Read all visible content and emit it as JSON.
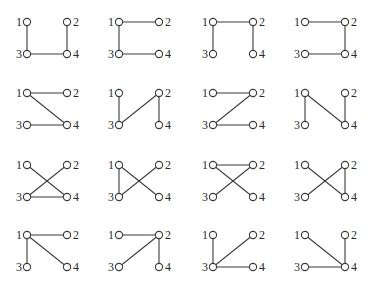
{
  "figure": {
    "colors": {
      "edge": "#3a3a3a",
      "node_stroke": "#3a3a3a",
      "node_fill": "#ffffff",
      "label": "#2a2a2a",
      "background": "#ffffff"
    },
    "node_labels": [
      "1",
      "2",
      "3",
      "4"
    ],
    "columns_x": [
      27,
      119,
      213,
      305
    ],
    "rows_y": [
      22,
      93,
      165,
      235
    ],
    "node_spacing": {
      "dx": 40,
      "dy": 32
    },
    "graphs": [
      {
        "row": 0,
        "col": 0,
        "edges": [
          [
            1,
            3
          ],
          [
            3,
            4
          ],
          [
            2,
            4
          ]
        ]
      },
      {
        "row": 0,
        "col": 1,
        "edges": [
          [
            1,
            2
          ],
          [
            1,
            3
          ],
          [
            3,
            4
          ]
        ]
      },
      {
        "row": 0,
        "col": 2,
        "edges": [
          [
            1,
            2
          ],
          [
            1,
            3
          ],
          [
            2,
            4
          ]
        ]
      },
      {
        "row": 0,
        "col": 3,
        "edges": [
          [
            1,
            2
          ],
          [
            2,
            4
          ],
          [
            3,
            4
          ]
        ]
      },
      {
        "row": 1,
        "col": 0,
        "edges": [
          [
            1,
            2
          ],
          [
            1,
            4
          ],
          [
            3,
            4
          ]
        ]
      },
      {
        "row": 1,
        "col": 1,
        "edges": [
          [
            1,
            3
          ],
          [
            2,
            3
          ],
          [
            2,
            4
          ]
        ]
      },
      {
        "row": 1,
        "col": 2,
        "edges": [
          [
            1,
            2
          ],
          [
            2,
            3
          ],
          [
            3,
            4
          ]
        ]
      },
      {
        "row": 1,
        "col": 3,
        "edges": [
          [
            1,
            3
          ],
          [
            1,
            4
          ],
          [
            2,
            4
          ]
        ]
      },
      {
        "row": 2,
        "col": 0,
        "edges": [
          [
            1,
            4
          ],
          [
            2,
            3
          ],
          [
            3,
            4
          ]
        ]
      },
      {
        "row": 2,
        "col": 1,
        "edges": [
          [
            1,
            3
          ],
          [
            1,
            4
          ],
          [
            2,
            3
          ]
        ]
      },
      {
        "row": 2,
        "col": 2,
        "edges": [
          [
            1,
            2
          ],
          [
            1,
            4
          ],
          [
            2,
            3
          ]
        ]
      },
      {
        "row": 2,
        "col": 3,
        "edges": [
          [
            1,
            4
          ],
          [
            2,
            3
          ],
          [
            2,
            4
          ]
        ]
      },
      {
        "row": 3,
        "col": 0,
        "edges": [
          [
            1,
            2
          ],
          [
            1,
            3
          ],
          [
            1,
            4
          ]
        ]
      },
      {
        "row": 3,
        "col": 1,
        "edges": [
          [
            1,
            2
          ],
          [
            2,
            3
          ],
          [
            2,
            4
          ]
        ]
      },
      {
        "row": 3,
        "col": 2,
        "edges": [
          [
            1,
            3
          ],
          [
            2,
            3
          ],
          [
            3,
            4
          ]
        ]
      },
      {
        "row": 3,
        "col": 3,
        "edges": [
          [
            1,
            4
          ],
          [
            2,
            4
          ],
          [
            3,
            4
          ]
        ]
      }
    ]
  }
}
